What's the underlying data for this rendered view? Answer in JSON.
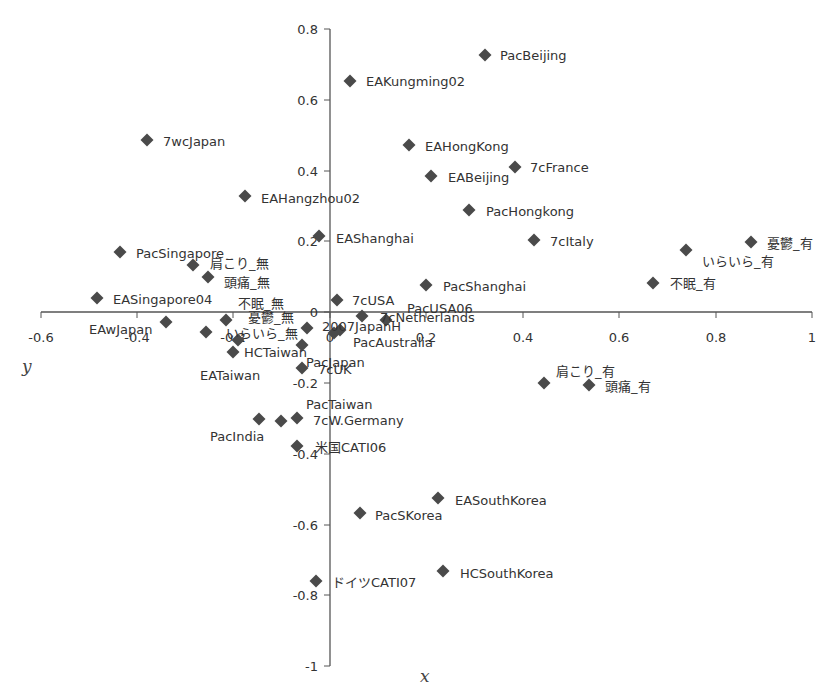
{
  "chart_data": {
    "type": "scatter",
    "title": "",
    "xlabel": "x",
    "ylabel": "y",
    "xlim": [
      -0.6,
      1
    ],
    "ylim": [
      -1,
      0.8
    ],
    "x_ticks": [
      "-0.6",
      "-0.4",
      "-0.2",
      "0",
      "0.2",
      "0.4",
      "0.6",
      "0.8",
      "1"
    ],
    "y_ticks": [
      "0.8",
      "0.6",
      "0.4",
      "0.2",
      "0",
      "-0.2",
      "-0.4",
      "-0.6",
      "-0.8",
      "-1"
    ],
    "grid": false,
    "legend": null,
    "marker": "diamond",
    "marker_color": "#4a4a4a",
    "points": [
      {
        "label": "PacBeijing",
        "x": 0.32,
        "y": 0.73
      },
      {
        "label": "EAKungming02",
        "x": 0.04,
        "y": 0.65
      },
      {
        "label": "7wcJapan",
        "x": -0.38,
        "y": 0.49
      },
      {
        "label": "EAHongKong",
        "x": 0.16,
        "y": 0.47
      },
      {
        "label": "7cFrance",
        "x": 0.38,
        "y": 0.41
      },
      {
        "label": "EABeijing",
        "x": 0.21,
        "y": 0.38
      },
      {
        "label": "EAHangzhou02",
        "x": -0.18,
        "y": 0.33
      },
      {
        "label": "PacHongkong",
        "x": 0.29,
        "y": 0.29
      },
      {
        "label": "EAShanghai",
        "x": -0.02,
        "y": 0.21
      },
      {
        "label": "7cItaly",
        "x": 0.42,
        "y": 0.2
      },
      {
        "label": "憂鬱_有",
        "x": 0.87,
        "y": 0.2
      },
      {
        "label": "いらいら_有",
        "x": 0.74,
        "y": 0.18
      },
      {
        "label": "PacSingapore",
        "x": -0.44,
        "y": 0.17
      },
      {
        "label": "肩こり_無",
        "x": -0.28,
        "y": 0.13
      },
      {
        "label": "頭痛_無",
        "x": -0.25,
        "y": 0.1
      },
      {
        "label": "不眠_有",
        "x": 0.67,
        "y": 0.08
      },
      {
        "label": "PacShanghai",
        "x": 0.2,
        "y": 0.08
      },
      {
        "label": "EASingapore04",
        "x": -0.48,
        "y": 0.04
      },
      {
        "label": "7cUSA",
        "x": 0.01,
        "y": 0.03
      },
      {
        "label": "PacUSA06",
        "x": 0.07,
        "y": -0.01
      },
      {
        "label": "7cNetherlands",
        "x": 0.12,
        "y": -0.02
      },
      {
        "label": "EAwJapan",
        "x": -0.34,
        "y": -0.03
      },
      {
        "label": "不眠_無",
        "x": -0.21,
        "y": -0.02
      },
      {
        "label": "憂鬱_無",
        "x": -0.05,
        "y": -0.05
      },
      {
        "label": "いらいら_無",
        "x": -0.21,
        "y": -0.06
      },
      {
        "label": "2007JapanH",
        "x": 0.01,
        "y": -0.06
      },
      {
        "label": "HCTaiwan",
        "x": -0.19,
        "y": -0.08
      },
      {
        "label": "EATaiwan",
        "x": -0.2,
        "y": -0.11
      },
      {
        "label": "PacJapan",
        "x": -0.06,
        "y": -0.09
      },
      {
        "label": "PacAustralia",
        "x": 0.02,
        "y": -0.05
      },
      {
        "label": "7cUK",
        "x": -0.06,
        "y": -0.16
      },
      {
        "label": "肩こり_有",
        "x": 0.44,
        "y": -0.2
      },
      {
        "label": "頭痛_有",
        "x": 0.54,
        "y": -0.21
      },
      {
        "label": "PacIndia",
        "x": -0.15,
        "y": -0.3
      },
      {
        "label": "PacTaiwan",
        "x": -0.1,
        "y": -0.31
      },
      {
        "label": "7cW.Germany",
        "x": -0.07,
        "y": -0.3
      },
      {
        "label": "米国CATI06",
        "x": -0.07,
        "y": -0.38
      },
      {
        "label": "EASouthKorea",
        "x": 0.22,
        "y": -0.53
      },
      {
        "label": "PacSKorea",
        "x": 0.06,
        "y": -0.57
      },
      {
        "label": "HCSouthKorea",
        "x": 0.23,
        "y": -0.73
      },
      {
        "label": "ドイツCATI07",
        "x": -0.03,
        "y": -0.76
      }
    ]
  },
  "labels": {
    "x_axis_title": "x",
    "y_axis_title": "y",
    "x_ticks": [
      {
        "text": "-0.6",
        "px": 41,
        "py": 342
      },
      {
        "text": "-0.4",
        "px": 137,
        "py": 342
      },
      {
        "text": "-0.2",
        "px": 233,
        "py": 342
      },
      {
        "text": "0",
        "px": 330,
        "py": 342
      },
      {
        "text": "0.2",
        "px": 426,
        "py": 342
      },
      {
        "text": "0.4",
        "px": 523,
        "py": 342
      },
      {
        "text": "0.6",
        "px": 619,
        "py": 342
      },
      {
        "text": "0.8",
        "px": 716,
        "py": 342
      },
      {
        "text": "1",
        "px": 812,
        "py": 342
      }
    ],
    "y_ticks": [
      {
        "text": "0.8",
        "py": 29
      },
      {
        "text": "0.6",
        "py": 100
      },
      {
        "text": "0.4",
        "py": 171
      },
      {
        "text": "0.2",
        "py": 241
      },
      {
        "text": "0",
        "py": 312
      },
      {
        "text": "-0.2",
        "py": 383
      },
      {
        "text": "-0.4",
        "py": 454
      },
      {
        "text": "-0.6",
        "py": 525
      },
      {
        "text": "-0.8",
        "py": 595
      },
      {
        "text": "-1",
        "py": 666
      }
    ],
    "points": [
      {
        "text": "PacBeijing",
        "mx": 485,
        "my": 55,
        "lx": 500,
        "ly": 60
      },
      {
        "text": "EAKungming02",
        "mx": 350,
        "my": 81,
        "lx": 366,
        "ly": 86
      },
      {
        "text": "7wcJapan",
        "mx": 147,
        "my": 140,
        "lx": 163,
        "ly": 146
      },
      {
        "text": "EAHongKong",
        "mx": 409,
        "my": 145,
        "lx": 425,
        "ly": 151
      },
      {
        "text": "7cFrance",
        "mx": 515,
        "my": 167,
        "lx": 530,
        "ly": 172
      },
      {
        "text": "EABeijing",
        "mx": 431,
        "my": 176,
        "lx": 448,
        "ly": 182
      },
      {
        "text": "EAHangzhou02",
        "mx": 245,
        "my": 196,
        "lx": 261,
        "ly": 203
      },
      {
        "text": "PacHongkong",
        "mx": 469,
        "my": 210,
        "lx": 486,
        "ly": 216
      },
      {
        "text": "EAShanghai",
        "mx": 319,
        "my": 236,
        "lx": 336,
        "ly": 243
      },
      {
        "text": "7cItaly",
        "mx": 534,
        "my": 240,
        "lx": 550,
        "ly": 246
      },
      {
        "text": "憂鬱_有",
        "mx": 751,
        "my": 242,
        "lx": 767,
        "ly": 248
      },
      {
        "text": "いらいら_有",
        "mx": 686,
        "my": 250,
        "lx": 702,
        "ly": 266
      },
      {
        "text": "PacSingapore",
        "mx": 120,
        "my": 252,
        "lx": 136,
        "ly": 258
      },
      {
        "text": "肩こり_無",
        "mx": 193,
        "my": 265,
        "lx": 210,
        "ly": 268
      },
      {
        "text": "頭痛_無",
        "mx": 208,
        "my": 277,
        "lx": 224,
        "ly": 287
      },
      {
        "text": "不眠_有",
        "mx": 653,
        "my": 283,
        "lx": 670,
        "ly": 288
      },
      {
        "text": "PacShanghai",
        "mx": 426,
        "my": 285,
        "lx": 443,
        "ly": 291
      },
      {
        "text": "EASingapore04",
        "mx": 97,
        "my": 298,
        "lx": 113,
        "ly": 304
      },
      {
        "text": "不眠_無",
        "mx": 226,
        "my": 320,
        "lx": 238,
        "ly": 308
      },
      {
        "text": "7cUSA",
        "mx": 337,
        "my": 300,
        "lx": 352,
        "ly": 305
      },
      {
        "text": "PacUSA06",
        "mx": 362,
        "my": 316,
        "lx": 407,
        "ly": 313
      },
      {
        "text": "7cNetherlands",
        "mx": 386,
        "my": 320,
        "lx": 380,
        "ly": 322
      },
      {
        "text": "EAwJapan",
        "mx": 166,
        "my": 322,
        "lx": 89,
        "ly": 334
      },
      {
        "text": "憂鬱_無",
        "mx": 307,
        "my": 328,
        "lx": 248,
        "ly": 322
      },
      {
        "text": "いらいら_無",
        "mx": 206,
        "my": 332,
        "lx": 226,
        "ly": 338
      },
      {
        "text": "2007JapanH",
        "mx": 334,
        "my": 333,
        "lx": 322,
        "ly": 331
      },
      {
        "text": "HCTaiwan",
        "mx": 238,
        "my": 340,
        "lx": 244,
        "ly": 357
      },
      {
        "text": "EATaiwan",
        "mx": 233,
        "my": 352,
        "lx": 200,
        "ly": 380
      },
      {
        "text": "PacJapan",
        "mx": 302,
        "my": 345,
        "lx": 306,
        "ly": 367
      },
      {
        "text": "PacAustralia",
        "mx": 340,
        "my": 330,
        "lx": 353,
        "ly": 347
      },
      {
        "text": "7cUK",
        "mx": 302,
        "my": 368,
        "lx": 318,
        "ly": 374
      },
      {
        "text": "肩こり_有",
        "mx": 544,
        "my": 383,
        "lx": 556,
        "ly": 376
      },
      {
        "text": "頭痛_有",
        "mx": 589,
        "my": 385,
        "lx": 605,
        "ly": 391
      },
      {
        "text": "PacIndia",
        "mx": 259,
        "my": 419,
        "lx": 210,
        "ly": 441
      },
      {
        "text": "PacTaiwan",
        "mx": 281,
        "my": 421,
        "lx": 306,
        "ly": 409
      },
      {
        "text": "7cW.Germany",
        "mx": 297,
        "my": 418,
        "lx": 313,
        "ly": 425
      },
      {
        "text": "米国CATI06",
        "mx": 297,
        "my": 446,
        "lx": 315,
        "ly": 452
      },
      {
        "text": "EASouthKorea",
        "mx": 438,
        "my": 498,
        "lx": 455,
        "ly": 505
      },
      {
        "text": "PacSKorea",
        "mx": 360,
        "my": 513,
        "lx": 375,
        "ly": 520
      },
      {
        "text": "HCSouthKorea",
        "mx": 443,
        "my": 571,
        "lx": 460,
        "ly": 578
      },
      {
        "text": "ドイツCATI07",
        "mx": 316,
        "my": 581,
        "lx": 332,
        "ly": 587
      }
    ]
  }
}
